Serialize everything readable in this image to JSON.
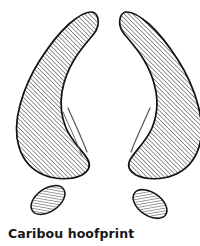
{
  "figure": {
    "title": "Caribou hoofprint",
    "caption": "Caribou hoofprint",
    "style": "pen-and-ink line drawing with diagonal hatching",
    "background_color": "#ffffff",
    "ink_color": "#111111",
    "hatch_color": "#3a3a3a",
    "caption_color": "#171717"
  },
  "parts": {
    "left_hoof": {
      "label": "left hoof cleat",
      "shape": "comma-teardrop",
      "hatch_angle_degrees": 45
    },
    "right_hoof": {
      "label": "right hoof cleat",
      "shape": "comma-teardrop-mirrored",
      "hatch_angle_degrees": 45
    },
    "left_dewclaw": {
      "label": "left dewclaw mark",
      "shape": "ellipse",
      "tilt_degrees": -35
    },
    "right_dewclaw": {
      "label": "right dewclaw mark",
      "shape": "ellipse",
      "tilt_degrees": 35
    }
  }
}
